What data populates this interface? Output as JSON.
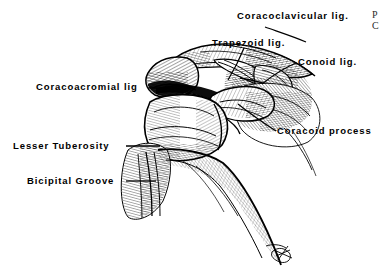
{
  "figure": {
    "background_color": "#ffffff",
    "ink_color": "#000000",
    "signature_present": true
  },
  "labels": {
    "coracoclavicular": "Coracoclavicular  lig.",
    "trapezoid": "Trapezoid lig.",
    "conoid": "Conoid  lig.",
    "coracoacromial": "Coracoacromial  lig",
    "coracoid_process": "Coracoid  process",
    "lesser_tuberosity": "Lesser  Tuberosity",
    "bicipital_groove": "Bicipital  Groove"
  },
  "corner_note": {
    "line1": "P",
    "line2": "C"
  },
  "structures": [
    {
      "name": "clavicle",
      "label_key": "coracoclavicular"
    },
    {
      "name": "acromion",
      "label_key": "coracoacromial"
    },
    {
      "name": "trapezoid-ligament",
      "label_key": "trapezoid"
    },
    {
      "name": "conoid-ligament",
      "label_key": "conoid"
    },
    {
      "name": "coracoid-process",
      "label_key": "coracoid_process"
    },
    {
      "name": "humeral-head",
      "label_key": null
    },
    {
      "name": "lesser-tuberosity",
      "label_key": "lesser_tuberosity"
    },
    {
      "name": "bicipital-groove",
      "label_key": "bicipital_groove"
    },
    {
      "name": "humeral-shaft",
      "label_key": null
    }
  ]
}
